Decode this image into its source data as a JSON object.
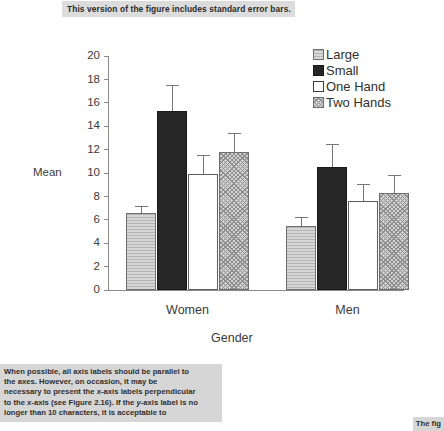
{
  "caption": {
    "text": "This version of the figure includes standard error bars."
  },
  "chart_data": {
    "type": "bar",
    "title": "",
    "xlabel": "Gender",
    "ylabel": "Mean",
    "categories": [
      "Women",
      "Men"
    ],
    "ylim": [
      0,
      20
    ],
    "ytick_step": 2,
    "yticks": [
      "20",
      "18",
      "16",
      "14",
      "12",
      "10",
      "8",
      "6",
      "4",
      "2",
      "0"
    ],
    "grid": false,
    "legend_position": "top-right",
    "error_bars": "standard error",
    "series": [
      {
        "name": "Large",
        "pattern": "horizontal-lines",
        "values": [
          6.6,
          5.5
        ],
        "errors": [
          0.6,
          0.7
        ]
      },
      {
        "name": "Small",
        "pattern": "solid-black",
        "values": [
          15.3,
          10.5
        ],
        "errors": [
          2.2,
          2.0
        ]
      },
      {
        "name": "One Hand",
        "pattern": "white",
        "values": [
          9.9,
          7.6
        ],
        "errors": [
          1.6,
          1.5
        ]
      },
      {
        "name": "Two Hands",
        "pattern": "crosshatch",
        "values": [
          11.8,
          8.3
        ],
        "errors": [
          1.6,
          1.5
        ]
      }
    ]
  },
  "body_text": {
    "line1": "When possible, all axis labels should be parallel to",
    "line2": "the axes. However, on occasion, it may be",
    "line3_a": "necessary to present the ",
    "line3_i": "x",
    "line3_b": "-axis labels perpendicular",
    "line4_a": "to the ",
    "line4_i1": "x",
    "line4_b": "-axis (see Figure 2.16). If the ",
    "line4_i2": "y",
    "line4_c": "-axis label is no",
    "line5": "longer than 10 characters, it is acceptable to"
  },
  "corner_text": {
    "text": "The fig"
  }
}
